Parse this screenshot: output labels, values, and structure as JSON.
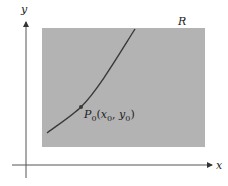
{
  "diagram": {
    "axes": {
      "x_label": "x",
      "y_label": "y"
    },
    "region": {
      "label": "R",
      "fill": "#b3b3b3"
    },
    "curve": {
      "color": "#3a3a3a"
    },
    "point": {
      "name": "P",
      "sub": "0",
      "open": "(",
      "x": "x",
      "x_sub": "0",
      "sep": ", ",
      "y": "y",
      "y_sub": "0",
      "close": ")"
    }
  }
}
